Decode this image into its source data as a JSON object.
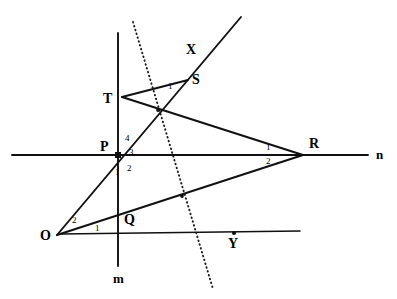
{
  "figure": {
    "background_color": "#ffffff",
    "stroke_color": "#101010"
  },
  "points": [
    {
      "id": "O",
      "label": "O",
      "x": 57,
      "y": 235,
      "label_x": 40,
      "label_y": 240,
      "marker": "none"
    },
    {
      "id": "P",
      "label": "P",
      "x": 118,
      "y": 155,
      "label_x": 100,
      "label_y": 151,
      "marker": "square"
    },
    {
      "id": "Q",
      "label": "Q",
      "x": 118,
      "y": 233,
      "label_x": 124,
      "label_y": 224,
      "marker": "none"
    },
    {
      "id": "R",
      "label": "R",
      "x": 303,
      "y": 155,
      "label_x": 309,
      "label_y": 148,
      "marker": "none"
    },
    {
      "id": "S",
      "label": "S",
      "x": 186,
      "y": 81,
      "label_x": 192,
      "label_y": 84,
      "marker": "none"
    },
    {
      "id": "T",
      "label": "T",
      "x": 122,
      "y": 97,
      "label_x": 103,
      "label_y": 103,
      "marker": "none"
    },
    {
      "id": "X",
      "label": "X",
      "x": 194,
      "y": 59,
      "label_x": 186,
      "label_y": 54,
      "marker": "none"
    },
    {
      "id": "Y",
      "label": "Y",
      "x": 234,
      "y": 233,
      "label_x": 228,
      "label_y": 248,
      "marker": "dot"
    }
  ],
  "line_labels": [
    {
      "id": "m",
      "label": "m",
      "x": 113,
      "y": 283
    },
    {
      "id": "n",
      "label": "n",
      "x": 376,
      "y": 159
    }
  ],
  "angle_labels": [
    {
      "id": "P-4",
      "label": "4",
      "x": 125,
      "y": 141
    },
    {
      "id": "P-3",
      "label": "3",
      "x": 129,
      "y": 155
    },
    {
      "id": "P-2",
      "label": "2",
      "x": 127,
      "y": 171
    },
    {
      "id": "P-1",
      "label": "1",
      "x": 115,
      "y": 175
    },
    {
      "id": "R-1",
      "label": "1",
      "x": 266,
      "y": 150
    },
    {
      "id": "R-2",
      "label": "2",
      "x": 266,
      "y": 164
    },
    {
      "id": "O-2",
      "label": "2",
      "x": 72,
      "y": 223
    },
    {
      "id": "O-1",
      "label": "1",
      "x": 95,
      "y": 231
    },
    {
      "id": "S-1",
      "label": "1",
      "x": 168,
      "y": 89
    }
  ],
  "segments": [
    {
      "id": "line-m-vertical",
      "kind": "solid",
      "x1": 118,
      "y1": 33,
      "x2": 118,
      "y2": 266
    },
    {
      "id": "line-n-horizontal",
      "kind": "solid",
      "x1": 12,
      "y1": 155,
      "x2": 368,
      "y2": 155
    },
    {
      "id": "line-through-Q-and-Y",
      "kind": "solid",
      "x1": 61,
      "y1": 234,
      "x2": 300,
      "y2": 231
    },
    {
      "id": "ray-O-to-X",
      "kind": "solid",
      "x1": 57,
      "y1": 235,
      "x2": 241,
      "y2": 17
    },
    {
      "id": "segment-T-to-S",
      "kind": "solid",
      "x1": 122,
      "y1": 97,
      "x2": 188,
      "y2": 80
    },
    {
      "id": "segment-T-to-R",
      "kind": "solid",
      "x1": 122,
      "y1": 97,
      "x2": 303,
      "y2": 155
    },
    {
      "id": "segment-O-to-R",
      "kind": "solid",
      "x1": 57,
      "y1": 235,
      "x2": 303,
      "y2": 155
    },
    {
      "id": "dotted-transversal",
      "kind": "dotted",
      "x1": 133,
      "y1": 22,
      "x2": 213,
      "y2": 289
    }
  ],
  "intersection_marks": [
    {
      "id": "intersection-TR-OX",
      "x": 158,
      "y": 110
    },
    {
      "id": "intersection-OR-dotted",
      "x": 182,
      "y": 196
    }
  ]
}
